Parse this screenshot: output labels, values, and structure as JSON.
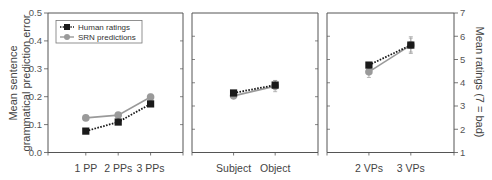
{
  "chart_data": {
    "type": "line",
    "title": "",
    "ylabel_left": "Mean sentence grammatical prediction error",
    "ylabel_right": "Mean ratings (7 = bad)",
    "ylim_left": [
      0.0,
      0.5
    ],
    "ylim_right": [
      1,
      7
    ],
    "yticks_left": [
      "0.0",
      "0.1",
      "0.2",
      "0.3",
      "0.4",
      "0.5"
    ],
    "yticks_right": [
      "1",
      "2",
      "3",
      "4",
      "5",
      "6",
      "7"
    ],
    "grid": false,
    "legend_position": "upper-left of first panel",
    "legend": [
      {
        "name": "Human ratings",
        "marker": "square",
        "line": "dotted",
        "color": "#1a1a1a",
        "axis": "right"
      },
      {
        "name": "SRN predictions",
        "marker": "circle",
        "line": "solid",
        "color": "#9a9a9a",
        "axis": "left"
      }
    ],
    "panels": [
      {
        "categories": [
          "1 PP",
          "2 PPs",
          "3 PPs"
        ],
        "series": [
          {
            "name": "Human ratings",
            "axis": "right",
            "values": [
              1.92,
              2.31,
              3.09
            ],
            "error": [
              0,
              0,
              0
            ]
          },
          {
            "name": "SRN predictions",
            "axis": "left",
            "values": [
              0.124,
              0.134,
              0.199
            ],
            "error": [
              0,
              0,
              0.01
            ]
          }
        ]
      },
      {
        "categories": [
          "Subject",
          "Object"
        ],
        "series": [
          {
            "name": "Human ratings",
            "axis": "right",
            "values": [
              3.56,
              3.9
            ],
            "error": [
              0.05,
              0.2
            ]
          },
          {
            "name": "SRN predictions",
            "axis": "left",
            "values": [
              0.203,
              0.238
            ],
            "error": [
              0.01,
              0.02
            ]
          }
        ]
      },
      {
        "categories": [
          "2 VPs",
          "3 VPs"
        ],
        "series": [
          {
            "name": "Human ratings",
            "axis": "right",
            "values": [
              4.76,
              5.62
            ],
            "error": [
              0.1,
              0.3
            ]
          },
          {
            "name": "SRN predictions",
            "axis": "left",
            "values": [
              0.289,
              0.385
            ],
            "error": [
              0.02,
              0.03
            ]
          }
        ]
      }
    ]
  }
}
